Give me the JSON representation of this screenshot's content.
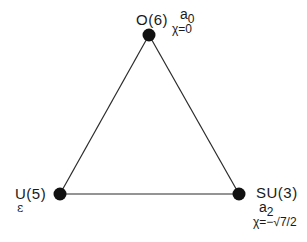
{
  "diagram": {
    "type": "triangle",
    "edge_color": "#2a2a2a",
    "node_color": "#111111",
    "nodes": [
      {
        "id": "O6",
        "name": "O(6)",
        "symmetry_label": "a",
        "symmetry_sub": "0",
        "chi_label": "χ=0",
        "x": 149,
        "y": 35
      },
      {
        "id": "U5",
        "name": "U(5)",
        "symmetry_label": "ε",
        "x": 60,
        "y": 194
      },
      {
        "id": "SU3",
        "name": "SU(3)",
        "symmetry_label": "a",
        "symmetry_sub": "2",
        "chi_label": "χ= −√7/2",
        "chi_prefix": "χ=",
        "chi_value": "−√7/2",
        "x": 239,
        "y": 194
      }
    ],
    "edges": [
      {
        "from": "O6",
        "to": "U5"
      },
      {
        "from": "O6",
        "to": "SU3"
      },
      {
        "from": "U5",
        "to": "SU3"
      }
    ]
  }
}
